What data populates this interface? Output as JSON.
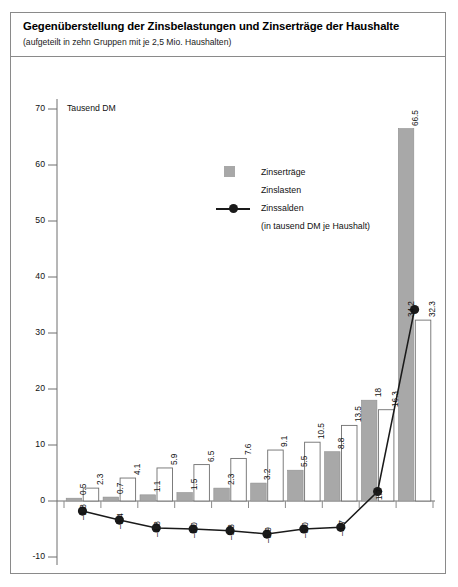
{
  "header": {
    "title": "Gegenüberstellung der Zinsbelastungen und Zinserträge der Haushalte",
    "subtitle": "(aufgeteilt in zehn Gruppen mit je 2,5 Mio. Haushalten)"
  },
  "legend": {
    "items": [
      {
        "label": "Zinserträge",
        "swatch": "gray-square",
        "color": "#a8a8a8"
      },
      {
        "label": "Zinslasten",
        "swatch": "white-square",
        "color": "#ffffff"
      },
      {
        "label": "Zinssalden",
        "swatch": "line-marker",
        "color": "#1a1a1a"
      },
      {
        "label": "(in tausend DM je Haushalt)",
        "swatch": "none",
        "color": "#1a1a1a"
      }
    ]
  },
  "chart_data": {
    "type": "bar",
    "title": "Gegenüberstellung der Zinsbelastungen und Zinserträge der Haushalte",
    "subtitle": "(aufgeteilt in zehn Gruppen mit je 2,5 Mio. Haushalten)",
    "xlabel": "",
    "ylabel": "Tausend DM",
    "ylim": [
      -10,
      70
    ],
    "yticks": [
      70,
      60,
      50,
      40,
      30,
      20,
      10,
      0,
      -10
    ],
    "ytick_labels": [
      "70",
      "60",
      "50",
      "40",
      "30",
      "20",
      "10",
      "0",
      "-10"
    ],
    "grid": false,
    "legend_position": "inside-upper-center",
    "categories": [
      "1",
      "2",
      "3",
      "4",
      "5",
      "6",
      "7",
      "8",
      "9",
      "10"
    ],
    "series": [
      {
        "name": "Zinserträge",
        "type": "bar",
        "color": "#a8a8a8",
        "values": [
          0.5,
          0.7,
          1.1,
          1.5,
          2.3,
          3.2,
          5.5,
          8.8,
          18,
          66.5
        ],
        "labels": [
          "0.5",
          "0.7",
          "1.1",
          "1.5",
          "2.3",
          "3.2",
          "5.5",
          "8.8",
          "18",
          "66.5"
        ]
      },
      {
        "name": "Zinslasten",
        "type": "bar",
        "color": "#ffffff",
        "values": [
          2.3,
          4.1,
          5.9,
          6.5,
          7.6,
          9.1,
          10.5,
          13.5,
          16.3,
          32.3
        ],
        "labels": [
          "2.3",
          "4.1",
          "5.9",
          "6.5",
          "7.6",
          "9.1",
          "10.5",
          "13.5",
          "16.3",
          "32.3"
        ]
      },
      {
        "name": "Zinssalden",
        "type": "line",
        "color": "#1a1a1a",
        "values": [
          -1.8,
          -3.4,
          -4.8,
          -5.0,
          -5.3,
          -5.9,
          -5.0,
          -4.7,
          1.7,
          34.2
        ],
        "labels": [
          "-1.8",
          "-3.4",
          "-4.8",
          "-5.0",
          "-5.3",
          "-5.9",
          "-5.0",
          "-4.7",
          "1.7",
          "34.2"
        ]
      }
    ]
  }
}
